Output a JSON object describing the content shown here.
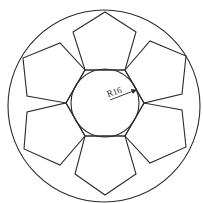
{
  "diagram": {
    "colors": {
      "line": "#2b2b2b",
      "background": "#ffffff"
    },
    "outer_circle": {
      "cx": 104,
      "cy": 106,
      "r": 96
    },
    "inner_circle": {
      "cx": 105,
      "cy": 103,
      "r": 34
    },
    "hexagon": {
      "points": "85,70 125,70 144,103 125,136 85,136 66,103"
    },
    "pentagons": [
      {
        "name": "top",
        "points": "85,70 125,70 136,32 105,12 73,32"
      },
      {
        "name": "upper-right",
        "points": "125,70 144,103 182,94 186,56 150,41"
      },
      {
        "name": "lower-right",
        "points": "144,103 125,136 150,163 186,147 182,110"
      },
      {
        "name": "bottom",
        "points": "125,136 85,136 75,174 105,195 136,174"
      },
      {
        "name": "lower-left",
        "points": "85,136 66,103 27,112 24,149 60,165"
      },
      {
        "name": "upper-left",
        "points": "66,103 85,70 60,43 23,58 27,96"
      }
    ],
    "dimension": {
      "label": "R16",
      "line": {
        "x1": 110,
        "y1": 100,
        "x2": 136,
        "y2": 90
      },
      "text_x": 108,
      "text_y": 97,
      "rotate": -18
    }
  }
}
